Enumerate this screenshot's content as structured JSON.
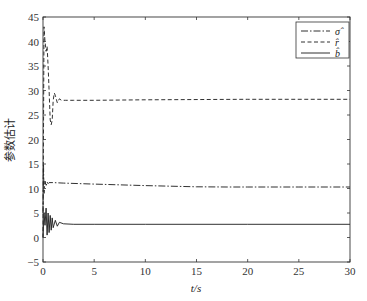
{
  "chart_data": {
    "type": "line",
    "title": "",
    "xlabel": "t/s",
    "ylabel": "参数估计",
    "xlim": [
      0,
      30
    ],
    "ylim": [
      -5,
      45
    ],
    "xticks": [
      0,
      5,
      10,
      15,
      20,
      25,
      30
    ],
    "yticks": [
      -5,
      0,
      5,
      10,
      15,
      20,
      25,
      30,
      35,
      40,
      45
    ],
    "grid": false,
    "legend_position": "upper right",
    "series": [
      {
        "name": "σ̂",
        "style": "dash-dot",
        "x": [
          0,
          0.05,
          0.1,
          0.2,
          0.3,
          0.4,
          0.5,
          0.6,
          1,
          2,
          5,
          10,
          15,
          18,
          20,
          25,
          30
        ],
        "values": [
          5,
          15,
          9,
          11.5,
          10.5,
          11.3,
          11.0,
          11.2,
          11.2,
          11.1,
          10.9,
          10.6,
          10.35,
          10.3,
          10.3,
          10.3,
          10.3
        ]
      },
      {
        "name": "r̂",
        "style": "dashed",
        "x": [
          0,
          0.1,
          0.2,
          0.3,
          0.4,
          0.5,
          0.6,
          0.7,
          0.8,
          0.9,
          1.0,
          1.1,
          1.2,
          1.4,
          1.6,
          1.8,
          2.2,
          3,
          5,
          10,
          20,
          30
        ],
        "values": [
          0,
          43,
          40,
          38,
          39,
          35,
          30,
          24,
          23,
          24,
          28,
          29.5,
          29,
          27.5,
          28.3,
          28.0,
          28.0,
          28.0,
          28.0,
          28.1,
          28.2,
          28.2
        ]
      },
      {
        "name": "b̂",
        "style": "solid",
        "x": [
          0,
          0.1,
          0.2,
          0.3,
          0.4,
          0.5,
          0.6,
          0.7,
          0.8,
          0.9,
          1.0,
          1.2,
          1.4,
          1.6,
          2,
          3,
          5,
          10,
          20,
          30
        ],
        "values": [
          0,
          5,
          2.5,
          6,
          0.5,
          5,
          1,
          4.5,
          1.5,
          4,
          2,
          3.5,
          2.3,
          3.1,
          2.8,
          2.7,
          2.7,
          2.7,
          2.7,
          2.7
        ]
      }
    ]
  },
  "legend": {
    "items": [
      {
        "label": "σ̂",
        "style": "dash-dot"
      },
      {
        "label": "r̂",
        "style": "dashed"
      },
      {
        "label": "b̂",
        "style": "solid"
      }
    ]
  },
  "colors": {
    "line": "#1a1a1a",
    "axis": "#333333",
    "background": "#ffffff"
  }
}
